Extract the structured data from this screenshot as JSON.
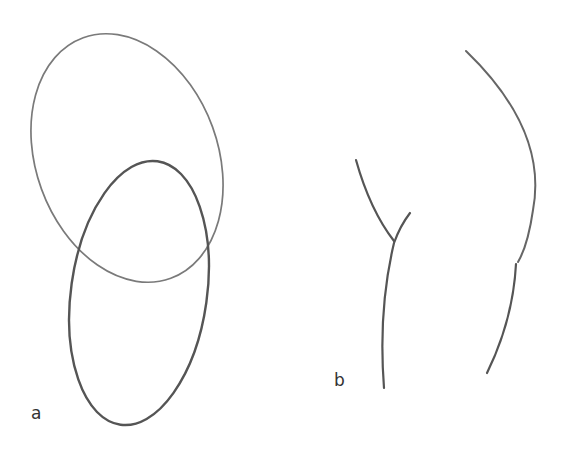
{
  "figure": {
    "panels": [
      {
        "id": "a",
        "label": "a",
        "description": "Two overlapping, interlinked ellipses (loops) drawn with pencil-like strokes",
        "shapes": [
          {
            "name": "upper-loop",
            "type": "ellipse",
            "cx": 127,
            "cy": 158,
            "rx": 91,
            "ry": 128,
            "rotate": -20,
            "stroke": "#7a7a7a",
            "stroke_width": 1.7
          },
          {
            "name": "lower-loop",
            "type": "ellipse",
            "cx": 139,
            "cy": 293,
            "rx": 68,
            "ry": 133,
            "rotate": 8,
            "stroke": "#555555",
            "stroke_width": 2.4
          }
        ]
      },
      {
        "id": "b",
        "label": "b",
        "description": "Broken strands: a Y-shaped junction on the left and an arc with a small break on the right",
        "shapes": [
          {
            "name": "left-upper-strand",
            "type": "path",
            "d": "M356 160 Q370 210 394 241",
            "stroke": "#555555",
            "stroke_width": 2.2
          },
          {
            "name": "left-branch-strand",
            "type": "path",
            "d": "M410 213 Q400 226 394 243 Q378 310 384 388",
            "stroke": "#555555",
            "stroke_width": 2.2
          },
          {
            "name": "right-upper-arc",
            "type": "path",
            "d": "M466 51 Q548 130 533 210 Q528 245 518 262",
            "stroke": "#666666",
            "stroke_width": 2.0
          },
          {
            "name": "right-lower-arc",
            "type": "path",
            "d": "M516 264 Q513 320 487 373",
            "stroke": "#555555",
            "stroke_width": 2.2
          }
        ]
      }
    ],
    "labels": {
      "a": "a",
      "b": "b"
    }
  }
}
